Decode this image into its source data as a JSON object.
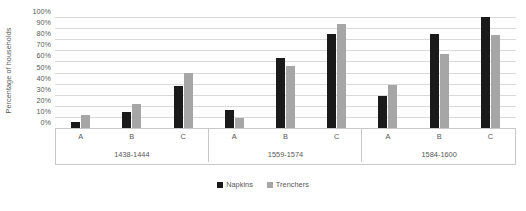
{
  "chart_data": {
    "type": "bar",
    "title": "",
    "xlabel": "",
    "ylabel": "Percentage of households",
    "ylim": [
      0,
      100
    ],
    "y_tick_labels": [
      "100%",
      "90%",
      "80%",
      "70%",
      "60%",
      "50%",
      "40%",
      "30%",
      "20%",
      "10%",
      "0%"
    ],
    "y_tick_values": [
      100,
      90,
      80,
      70,
      60,
      50,
      40,
      30,
      20,
      10,
      0
    ],
    "grid": true,
    "legend_position": "bottom",
    "categories": [
      "A",
      "B",
      "C"
    ],
    "groups": [
      {
        "label": "1438-1444",
        "categories": [
          "A",
          "B",
          "C"
        ],
        "series": [
          {
            "name": "Napkins",
            "values": [
              5,
              14,
              38
            ]
          },
          {
            "name": "Trenchers",
            "values": [
              12,
              22,
              50
            ]
          }
        ]
      },
      {
        "label": "1559-1574",
        "categories": [
          "A",
          "B",
          "C"
        ],
        "series": [
          {
            "name": "Napkins",
            "values": [
              16,
              63,
              85
            ]
          },
          {
            "name": "Trenchers",
            "values": [
              9,
              56,
              94
            ]
          }
        ]
      },
      {
        "label": "1584-1600",
        "categories": [
          "A",
          "B",
          "C"
        ],
        "series": [
          {
            "name": "Napkins",
            "values": [
              29,
              85,
              100
            ]
          },
          {
            "name": "Trenchers",
            "values": [
              39,
              67,
              84
            ]
          }
        ]
      }
    ],
    "legend": [
      {
        "name": "Napkins",
        "color": "#1a1a1a"
      },
      {
        "name": "Trenchers",
        "color": "#a6a6a6"
      }
    ]
  }
}
